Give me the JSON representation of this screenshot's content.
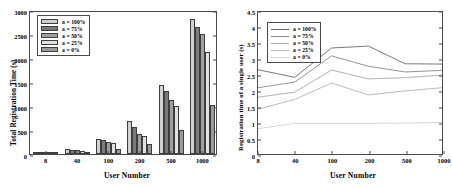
{
  "chart_data": [
    {
      "type": "bar",
      "panel": "left",
      "title": "",
      "xlabel": "User Number",
      "ylabel": "Total Registration Time (s)",
      "categories": [
        "8",
        "40",
        "100",
        "200",
        "500",
        "1000"
      ],
      "ylim": [
        0,
        3000
      ],
      "yticks": [
        0,
        500,
        1000,
        1500,
        2000,
        2500,
        3000
      ],
      "grid": false,
      "legend_position": "upper-left",
      "series": [
        {
          "name": "a = 100%",
          "color": "#d0d0d0",
          "values": [
            22,
            100,
            320,
            680,
            1430,
            2820
          ]
        },
        {
          "name": "a = 75%",
          "color": "#7a7a7a",
          "values": [
            19,
            92,
            300,
            560,
            1310,
            2640
          ]
        },
        {
          "name": "a = 50%",
          "color": "#a0a0a0",
          "values": [
            16,
            80,
            255,
            415,
            1130,
            2490
          ]
        },
        {
          "name": "a = 25%",
          "color": "#e0e0e0",
          "values": [
            13,
            68,
            225,
            370,
            1010,
            2120
          ]
        },
        {
          "name": "a = 0%",
          "color": "#9a9a9a",
          "values": [
            8,
            42,
            105,
            210,
            500,
            1030
          ]
        }
      ]
    },
    {
      "type": "line",
      "panel": "right",
      "title": "",
      "xlabel": "User Number",
      "ylabel": "Registration time of a single user (s)",
      "x": [
        "8",
        "40",
        "100",
        "200",
        "500",
        "1000"
      ],
      "ylim": [
        0,
        4.5
      ],
      "yticks": [
        0,
        0.5,
        1,
        1.5,
        2,
        2.5,
        3,
        3.5,
        4,
        4.5
      ],
      "grid": false,
      "legend_position": "upper-left",
      "series": [
        {
          "name": "a = 100%",
          "color": "#6a6a6a",
          "values": [
            2.67,
            2.43,
            3.36,
            3.42,
            2.86,
            2.85
          ]
        },
        {
          "name": "a = 75%",
          "color": "#8a8a8a",
          "values": [
            2.1,
            2.28,
            3.11,
            2.78,
            2.6,
            2.65
          ]
        },
        {
          "name": "a = 50%",
          "color": "#a8a8a8",
          "values": [
            1.8,
            1.96,
            2.66,
            2.38,
            2.42,
            2.5
          ]
        },
        {
          "name": "a = 25%",
          "color": "#b4b4b4",
          "values": [
            1.42,
            1.73,
            2.25,
            1.87,
            2.0,
            2.1
          ]
        },
        {
          "name": "a = 0%",
          "color": "#d2d2d2",
          "values": [
            0.8,
            0.97,
            0.97,
            0.97,
            0.98,
            1.0
          ]
        }
      ]
    }
  ],
  "axis_colors": {
    "frame": "#4a4a4a",
    "background": "#ffffff"
  }
}
